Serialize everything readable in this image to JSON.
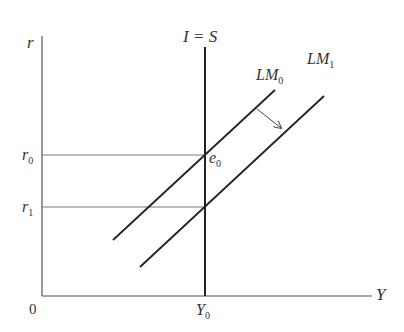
{
  "diagram": {
    "type": "IS-LM diagram (vertical I=S curve)",
    "axes": {
      "y_label": "r",
      "x_label": "Y",
      "origin_label": "0"
    },
    "curves": [
      {
        "id": "is",
        "label": "I = S"
      },
      {
        "id": "lm0",
        "label_main": "LM",
        "label_sub": "0"
      },
      {
        "id": "lm1",
        "label_main": "LM",
        "label_sub": "1"
      }
    ],
    "levels": {
      "r0": {
        "main": "r",
        "sub": "0"
      },
      "r1": {
        "main": "r",
        "sub": "1"
      },
      "y0": {
        "main": "Y",
        "sub": "0"
      }
    },
    "points": {
      "e0": {
        "main": "e",
        "sub": "0"
      }
    },
    "annotations": {
      "shift_arrow": "LM0 shifts right to LM1"
    },
    "colors": {
      "axis": "#555555",
      "curve": "#222222",
      "guide": "#666666",
      "text": "#333333"
    }
  }
}
